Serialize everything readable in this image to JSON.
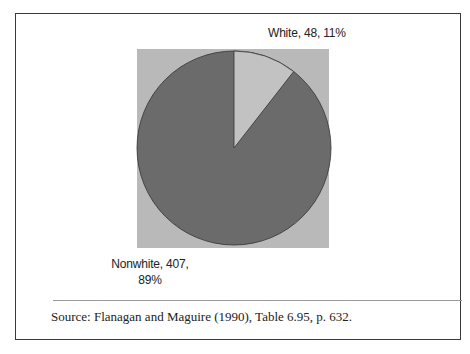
{
  "chart_data": {
    "type": "pie",
    "title": "",
    "categories": [
      "White",
      "Nonwhite"
    ],
    "values": [
      48,
      407
    ],
    "percentages": [
      11,
      89
    ],
    "labels": [
      "White, 48, 11%",
      "Nonwhite, 407, 89%"
    ],
    "colors": [
      "#c2c2c2",
      "#6b6b6b"
    ],
    "background": "#b9b9b9",
    "start_angle_deg": 90,
    "direction": "clockwise"
  },
  "labels": {
    "white": "White, 48, 11%",
    "nonwhite_line1": "Nonwhite, 407,",
    "nonwhite_line2": "89%"
  },
  "source": "Source: Flanagan and Maguire (1990), Table 6.95, p. 632."
}
